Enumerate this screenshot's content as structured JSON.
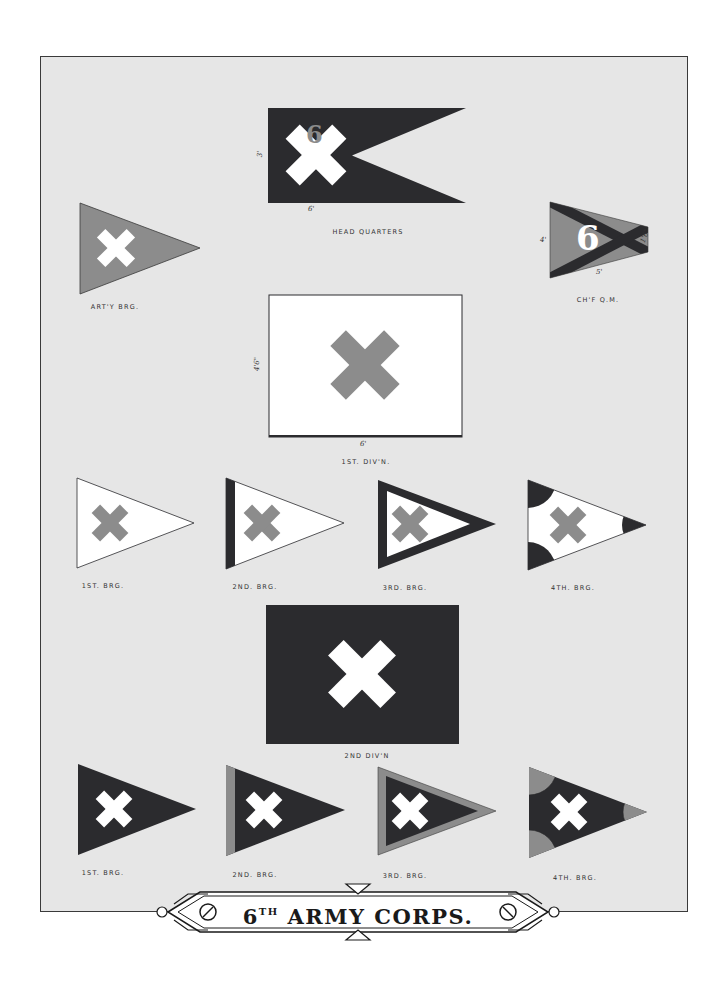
{
  "title": {
    "prefix": "6",
    "superscript": "TH",
    "main": "ARMY CORPS."
  },
  "colors": {
    "background": "#ffffff",
    "panel": "#e6e6e6",
    "dark_blue": "#2b2b2e",
    "red_gray": "#8c8c8c",
    "white": "#ffffff",
    "border": "#3a3a3a"
  },
  "flags": {
    "head_quarters": {
      "label": "HEAD QUARTERS",
      "shape": "swallowtail",
      "field": "dark",
      "emblem": "white cross with red 6",
      "numeral": "6",
      "dim_height": "3'",
      "dim_width": "6'"
    },
    "arty_brg": {
      "label": "ART'Y BRG.",
      "shape": "triangle",
      "field": "red",
      "emblem": "white cross"
    },
    "chf_qm": {
      "label": "CH'F Q.M.",
      "shape": "triangle",
      "field": "red",
      "emblem": "dark saltire with white 6",
      "numeral": "6",
      "dim_height": "4'",
      "dim_width": "5'",
      "dim_fly": "1'6\""
    },
    "first_div": {
      "label": "1ST. DIV'N.",
      "shape": "rectangle",
      "field": "white",
      "emblem": "red cross",
      "dim_height": "4'6\"",
      "dim_width": "6'"
    },
    "first_div_brigades": [
      {
        "label": "1ST. BRG.",
        "style": "plain"
      },
      {
        "label": "2ND. BRG.",
        "style": "hoist-stripe"
      },
      {
        "label": "3RD. BRG.",
        "style": "border"
      },
      {
        "label": "4TH. BRG.",
        "style": "corner-circles"
      }
    ],
    "second_div": {
      "label": "2ND DIV'N",
      "shape": "rectangle",
      "field": "dark",
      "emblem": "white cross"
    },
    "second_div_brigades": [
      {
        "label": "1ST. BRG.",
        "style": "plain"
      },
      {
        "label": "2ND. BRG.",
        "style": "hoist-stripe"
      },
      {
        "label": "3RD. BRG.",
        "style": "border"
      },
      {
        "label": "4TH. BRG.",
        "style": "corner-circles"
      }
    ]
  }
}
